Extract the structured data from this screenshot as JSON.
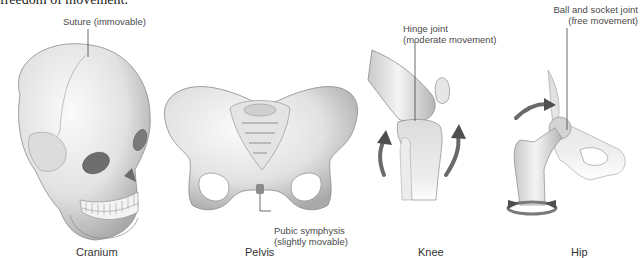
{
  "intro_text": "freedom of movement.",
  "figures": [
    {
      "caption": "Cranium",
      "label": "Suture (immovable)"
    },
    {
      "caption": "Pelvis",
      "label_line1": "Pubic symphysis",
      "label_line2": "(slightly movable)"
    },
    {
      "caption": "Knee",
      "label_line1": "Hinge joint",
      "label_line2": "(moderate movement)"
    },
    {
      "caption": "Hip",
      "label_line1": "Ball and socket joint",
      "label_line2": "(free movement)"
    }
  ],
  "colors": {
    "bone_light": "#f2f2f2",
    "bone_mid": "#cfcfcf",
    "bone_dark": "#8e8e8e",
    "outline": "#7a7a7a",
    "arrow": "#5a5a5a",
    "leader": "#444444"
  }
}
